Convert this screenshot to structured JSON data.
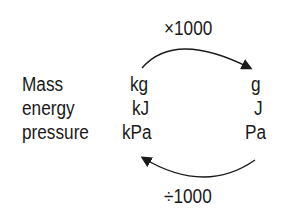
{
  "diagram": {
    "top_factor": "×1000",
    "bottom_factor": "÷1000",
    "rows": [
      {
        "quantity": "Mass",
        "large_unit": "kg",
        "small_unit": "g"
      },
      {
        "quantity": "energy",
        "large_unit": "kJ",
        "small_unit": "J"
      },
      {
        "quantity": "pressure",
        "large_unit": "kPa",
        "small_unit": "Pa"
      }
    ],
    "arrows": [
      {
        "from": "kg",
        "to": "g",
        "label": "×1000",
        "position": "top"
      },
      {
        "from": "Pa",
        "to": "kPa",
        "label": "÷1000",
        "position": "bottom"
      }
    ]
  }
}
